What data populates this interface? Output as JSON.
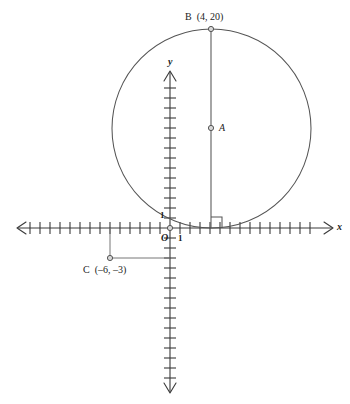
{
  "figure": {
    "type": "coordinate-geometry-diagram",
    "background_color": "#ffffff",
    "stroke_color": "#3a3a3a",
    "text_color": "#1c1c1c"
  },
  "axes": {
    "x_label": "x",
    "y_label": "y",
    "origin_label": "O",
    "x_unit_label": "1",
    "y_unit_label": "1",
    "tick_spacing_px": 10,
    "x_axis_y_px": 228,
    "y_axis_x_px": 170,
    "x_ticks_left": 15,
    "x_ticks_right": 16,
    "y_ticks_up": 17,
    "y_ticks_down": 16
  },
  "points": [
    {
      "id": "B",
      "label": "B",
      "coord_label": "(4, 20)",
      "full_label": "B  (4, 20)",
      "x": 4,
      "y": 20,
      "px": 211,
      "py": 29,
      "marker": "open-circle"
    },
    {
      "id": "A",
      "label": "A",
      "coord_label": "",
      "full_label": "A",
      "px": 211,
      "py": 128,
      "marker": "open-circle",
      "role": "circle-center"
    },
    {
      "id": "C",
      "label": "C",
      "coord_label": "(–6, –3)",
      "full_label": "C  (–6, –3)",
      "x": -6,
      "y": -3,
      "px": 110,
      "py": 258,
      "marker": "open-circle"
    },
    {
      "id": "O",
      "label": "O",
      "coord_label": "",
      "full_label": "O",
      "x": 0,
      "y": 0,
      "px": 170,
      "py": 228,
      "marker": "open-circle",
      "role": "origin"
    }
  ],
  "circle": {
    "center_px": {
      "x": 211.5,
      "y": 128.5
    },
    "radius_px": 100,
    "tangent_to": "x-axis"
  },
  "segments": [
    {
      "id": "AB-radius",
      "from": "B",
      "to": "tangent-point",
      "note": "vertical line from B through A down to the x-axis"
    },
    {
      "id": "C-vertical",
      "from": "C",
      "to": "x-axis",
      "note": "vertical dashed-style leader from C up to the x-axis"
    },
    {
      "id": "C-horizontal",
      "from": "C",
      "to": "y-axis",
      "note": "horizontal leader from C right to the y-axis"
    }
  ],
  "markers": {
    "right_angle": {
      "present": true,
      "at_px": {
        "x": 211,
        "y": 228
      },
      "size_px": 11,
      "note": "right-angle square where the vertical radius meets the x-axis"
    }
  }
}
